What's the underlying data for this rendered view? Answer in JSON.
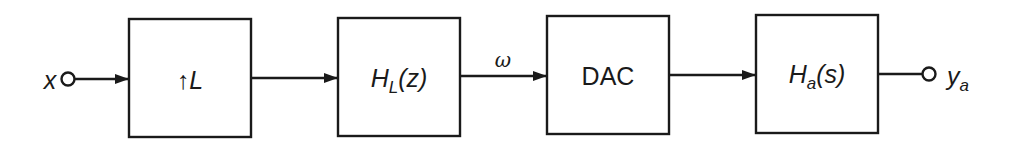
{
  "diagram": {
    "type": "signal-flow block diagram",
    "colors": {
      "stroke": "#1a1a1a",
      "background": "#ffffff"
    },
    "input": {
      "symbol": "x"
    },
    "output": {
      "symbol": "y",
      "subscript": "a"
    },
    "blocks": [
      {
        "id": "upsampler",
        "prefix": "↑",
        "symbol": "L"
      },
      {
        "id": "interp-filter",
        "symbol": "H",
        "subscript": "L",
        "arg": "(z)"
      },
      {
        "id": "dac",
        "label": "DAC"
      },
      {
        "id": "analog-filter",
        "symbol": "H",
        "subscript": "a",
        "arg": "(s)"
      }
    ],
    "edges": [
      {
        "from": "x",
        "to": "upsampler",
        "label": ""
      },
      {
        "from": "upsampler",
        "to": "interp-filter",
        "label": ""
      },
      {
        "from": "interp-filter",
        "to": "dac",
        "label": "ω"
      },
      {
        "from": "dac",
        "to": "analog-filter",
        "label": ""
      },
      {
        "from": "analog-filter",
        "to": "y_a",
        "label": ""
      }
    ]
  }
}
